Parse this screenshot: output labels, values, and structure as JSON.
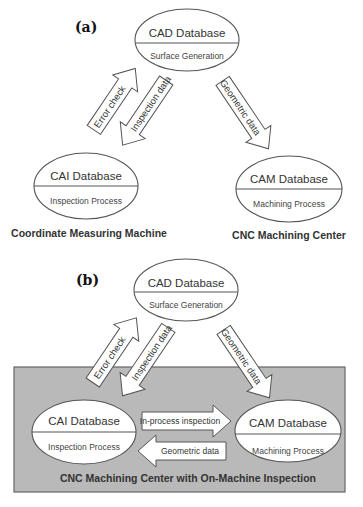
{
  "colors": {
    "background": "#ffffff",
    "box_fill": "#b9b9b9",
    "stroke": "#555555",
    "text": "#333333"
  },
  "panel_a": {
    "label": "(a)",
    "cad": {
      "title": "CAD Database",
      "subtitle": "Surface Generation"
    },
    "cai": {
      "title": "CAI Database",
      "subtitle": "Inspection Process"
    },
    "cam": {
      "title": "CAM Database",
      "subtitle": "Machining Process"
    },
    "arrows": {
      "error_check": "Error check",
      "inspection_data": "Inspection data",
      "geometric_data": "Geometric data"
    },
    "machines": {
      "left": "Coordinate Measuring Machine",
      "right": "CNC Machining Center"
    }
  },
  "panel_b": {
    "label": "(b)",
    "cad": {
      "title": "CAD Database",
      "subtitle": "Surface Generation"
    },
    "cai": {
      "title": "CAI Database",
      "subtitle": "Inspection Process"
    },
    "cam": {
      "title": "CAM Database",
      "subtitle": "Machining Process"
    },
    "arrows": {
      "error_check": "Error check",
      "inspection_data": "Inspection data",
      "geometric_data": "Geometric data",
      "in_process_inspection": "In-process inspection",
      "geometric_data_back": "Geometric data"
    },
    "box_label": "CNC Machining Center with On-Machine Inspection"
  }
}
